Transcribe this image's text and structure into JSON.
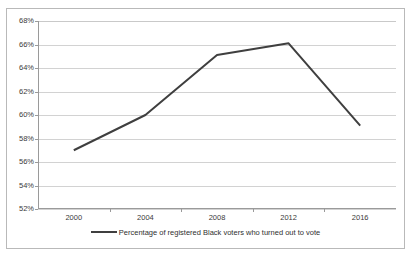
{
  "chart_data": {
    "type": "line",
    "title": "",
    "xlabel": "",
    "ylabel": "",
    "categories": [
      "2000",
      "2004",
      "2008",
      "2012",
      "2016"
    ],
    "series": [
      {
        "name": "Percentage of registered Black voters who turned out to vote",
        "values": [
          57.0,
          60.0,
          65.1,
          66.1,
          59.1
        ],
        "color": "#3f3f3f"
      }
    ],
    "ylim": [
      52,
      68
    ],
    "ytick_values": [
      52,
      54,
      56,
      58,
      60,
      62,
      64,
      66,
      68
    ],
    "ytick_labels": [
      "52%",
      "54%",
      "56%",
      "58%",
      "60%",
      "62%",
      "64%",
      "66%",
      "68%"
    ],
    "grid": true,
    "grid_axis": "y",
    "legend": true,
    "legend_position": "bottom",
    "legend_entries": [
      "Percentage of registered Black voters who turned out to vote"
    ],
    "gridline_color": "#d2d2d2",
    "axis_color": "#9a9a9a",
    "border_color": "#b9b9b9",
    "background_color": "#ffffff",
    "annotations": []
  },
  "legend": {
    "label": "Percentage of registered Black voters who turned out to vote"
  }
}
